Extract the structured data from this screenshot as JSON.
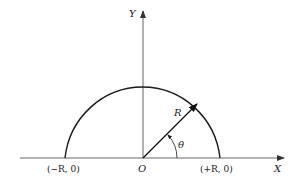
{
  "diagram": {
    "axes": {
      "x_label": "X",
      "y_label": "Y",
      "origin_label": "O"
    },
    "semicircle": {
      "radius_label": "R",
      "angle_label": "θ",
      "left_point_label": "(−R, 0)",
      "right_point_label": "(+R, 0)"
    },
    "colors": {
      "stroke": "#1a1a1a",
      "axis": "#555555",
      "background": "#ffffff"
    }
  }
}
